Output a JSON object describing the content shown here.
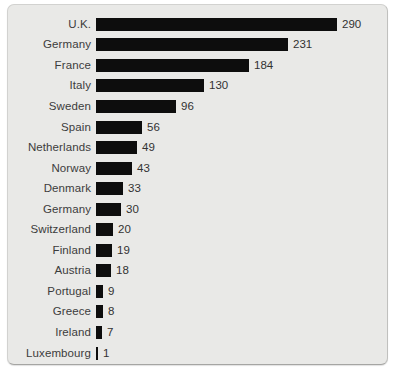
{
  "window": {
    "background_color": "#ffffff"
  },
  "panel": {
    "background_color": "#e9e9e7",
    "border_color": "#d2d2d0",
    "bottom_edge_color": "#a5a5a3",
    "right_edge_color": "#c0c0be"
  },
  "chart_data": {
    "type": "bar",
    "orientation": "horizontal",
    "title": "",
    "xlabel": "",
    "ylabel": "",
    "categories": [
      "U.K.",
      "Germany",
      "France",
      "Italy",
      "Sweden",
      "Spain",
      "Netherlands",
      "Norway",
      "Denmark",
      "Germany",
      "Switzerland",
      "Finland",
      "Austria",
      "Portugal",
      "Greece",
      "Ireland",
      "Luxembourg"
    ],
    "values": [
      290,
      231,
      184,
      130,
      96,
      56,
      49,
      43,
      33,
      30,
      20,
      19,
      18,
      9,
      8,
      7,
      1
    ],
    "value_labels_shown": true,
    "bar_color": "#0d0d0d",
    "label_color": "#3c3c3c",
    "value_color": "#323232",
    "xlim": [
      0,
      300
    ],
    "grid": false,
    "legend": false,
    "axes_shown": false
  }
}
